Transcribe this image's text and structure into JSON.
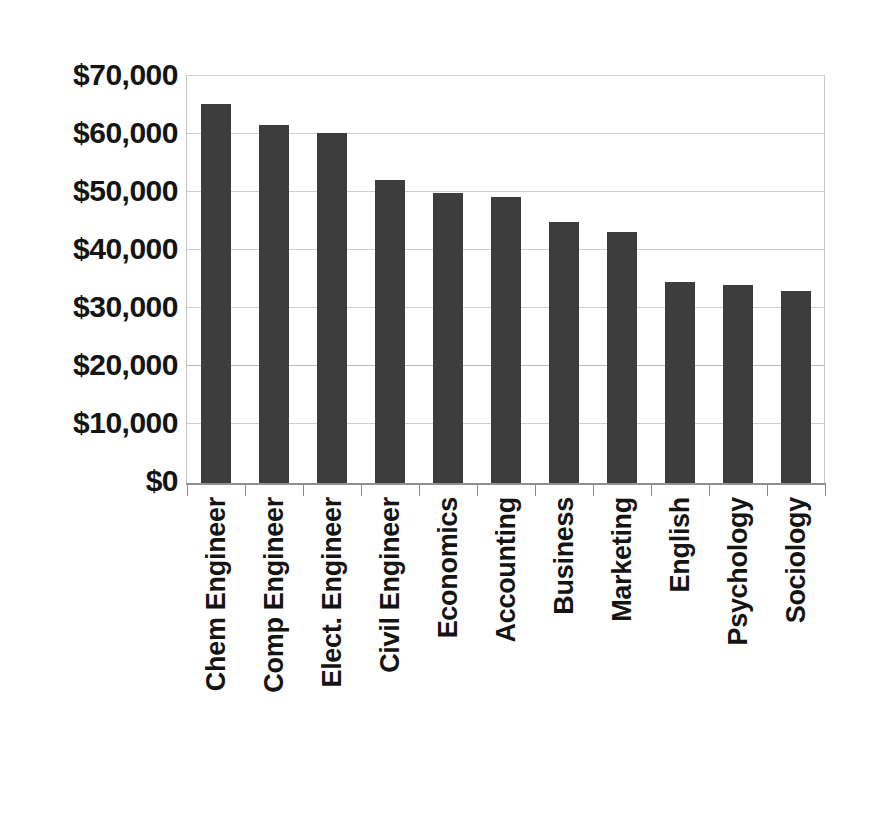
{
  "chart_data": {
    "type": "bar",
    "title": "",
    "subtitle": "",
    "xlabel": "",
    "ylabel": "",
    "ylim": [
      0,
      70000
    ],
    "ytick_values": [
      0,
      10000,
      20000,
      30000,
      40000,
      50000,
      60000,
      70000
    ],
    "ytick_labels": [
      "$0",
      "$10,000",
      "$20,000",
      "$30,000",
      "$40,000",
      "$50,000",
      "$60,000",
      "$70,000"
    ],
    "grid": true,
    "legend": "none",
    "bar_color": "#3d3d3d",
    "gridline_color": "#cfcfcf",
    "axis_color": "#8f8f8f",
    "categories": [
      "Chem Engineer",
      "Comp Engineer",
      "Elect. Engineer",
      "Civil Engineer",
      "Economics",
      "Accounting",
      "Business",
      "Marketing",
      "English",
      "Psychology",
      "Sociology"
    ],
    "values": [
      65000,
      61500,
      60000,
      52000,
      49700,
      49000,
      44700,
      43000,
      34500,
      34000,
      33000
    ],
    "series": [
      {
        "name": "Starting Salary",
        "values": [
          65000,
          61500,
          60000,
          52000,
          49700,
          49000,
          44700,
          43000,
          34500,
          34000,
          33000
        ]
      }
    ]
  }
}
